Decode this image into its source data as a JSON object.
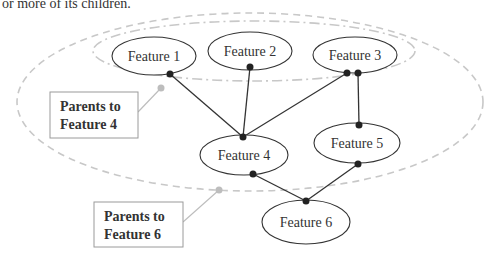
{
  "caption": "or more of its children.",
  "nodes": [
    {
      "id": "f1",
      "label": "Feature 1",
      "cx": 154,
      "cy": 56,
      "rx": 42,
      "ry": 19
    },
    {
      "id": "f2",
      "label": "Feature 2",
      "cx": 250,
      "cy": 51,
      "rx": 42,
      "ry": 19
    },
    {
      "id": "f3",
      "label": "Feature 3",
      "cx": 355,
      "cy": 55,
      "rx": 42,
      "ry": 18
    },
    {
      "id": "f4",
      "label": "Feature 4",
      "cx": 244,
      "cy": 155,
      "rx": 44,
      "ry": 20
    },
    {
      "id": "f5",
      "label": "Feature 5",
      "cx": 357,
      "cy": 143,
      "rx": 43,
      "ry": 20
    },
    {
      "id": "f6",
      "label": "Feature 6",
      "cx": 306,
      "cy": 222,
      "rx": 44,
      "ry": 22
    }
  ],
  "edges": [
    {
      "from": "f1",
      "to": "f4",
      "x1": 170,
      "y1": 74,
      "x2": 243,
      "y2": 137
    },
    {
      "from": "f2",
      "to": "f4",
      "x1": 250,
      "y1": 67,
      "x2": 243,
      "y2": 137
    },
    {
      "from": "f3",
      "to": "f4",
      "x1": 347,
      "y1": 73,
      "x2": 243,
      "y2": 137
    },
    {
      "from": "f3",
      "to": "f5",
      "x1": 358,
      "y1": 73,
      "x2": 359,
      "y2": 125
    },
    {
      "from": "f4",
      "to": "f6",
      "x1": 253,
      "y1": 174,
      "x2": 306,
      "y2": 201
    },
    {
      "from": "f5",
      "to": "f6",
      "x1": 358,
      "y1": 164,
      "x2": 306,
      "y2": 201
    }
  ],
  "groups": [
    {
      "id": "parents-f4",
      "line1": "Parents to",
      "line2": "Feature 4",
      "style": "dash-dot"
    },
    {
      "id": "parents-f6",
      "line1": "Parents to",
      "line2": "Feature 6",
      "style": "dashed"
    }
  ],
  "colors": {
    "node_stroke": "#333333",
    "edge": "#333333",
    "group_outline": "#c8c8c8",
    "callout_dot": "#bdbdbd",
    "label_box_border": "#9a9a9a"
  }
}
